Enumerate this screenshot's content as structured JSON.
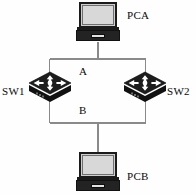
{
  "diagram": {
    "background_color": "#fefefe",
    "line_color": "#8a8a8a",
    "device_color": "#1b1b1b",
    "text_color": "#0a0a0a",
    "nodes": [
      {
        "id": "pca",
        "type": "laptop",
        "label": "PCA",
        "x": 76,
        "y": 2,
        "label_x": 127,
        "label_y": 10
      },
      {
        "id": "sw1",
        "type": "switch",
        "label": "SW1",
        "x": 27,
        "y": 74,
        "label_x": 2,
        "label_y": 86
      },
      {
        "id": "sw2",
        "type": "switch",
        "label": "SW2",
        "x": 122,
        "y": 74,
        "label_x": 167,
        "label_y": 86
      },
      {
        "id": "pcb",
        "type": "laptop",
        "label": "PCB",
        "x": 76,
        "y": 152,
        "label_x": 127,
        "label_y": 171
      }
    ],
    "links": [
      {
        "id": "link-a",
        "label": "A",
        "from": "sw1",
        "to": "sw2",
        "label_x": 79,
        "label_y": 66
      },
      {
        "id": "link-b",
        "label": "B",
        "from": "sw1",
        "to": "sw2",
        "label_x": 79,
        "label_y": 105
      },
      {
        "id": "link-pca-bus",
        "label": "",
        "from": "pca",
        "to": "bus-top",
        "label_x": 0,
        "label_y": 0
      },
      {
        "id": "link-pcb-bus",
        "label": "",
        "from": "pcb",
        "to": "bus-bottom",
        "label_x": 0,
        "label_y": 0
      }
    ],
    "icons": {
      "laptop": "laptop-icon",
      "switch": "switch-icon"
    }
  }
}
